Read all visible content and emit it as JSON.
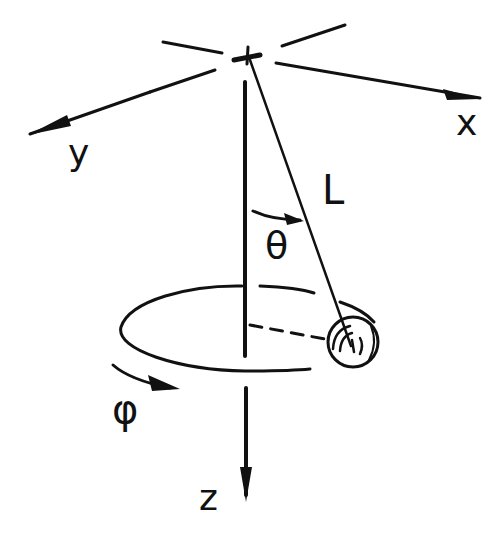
{
  "diagram": {
    "style": "hand-drawn sketch",
    "colors": {
      "ink": "#111111",
      "background": "#ffffff"
    },
    "labels": {
      "x_axis": "x",
      "y_axis": "y",
      "z_axis": "z",
      "length": "L",
      "polar_angle": "θ",
      "azimuthal_angle": "φ"
    },
    "elements": [
      {
        "id": "pivot",
        "description": "suspension point at origin (marked with a cross)"
      },
      {
        "id": "x-axis",
        "description": "arrow pointing right-down toward x"
      },
      {
        "id": "y-axis",
        "description": "arrow pointing left-down toward y"
      },
      {
        "id": "z-axis",
        "description": "vertical axis pointing downward toward z"
      },
      {
        "id": "string",
        "description": "pendulum string of length L from pivot to bob"
      },
      {
        "id": "theta-arc",
        "description": "arc with arrow between z-axis and string, labeled θ"
      },
      {
        "id": "orbit-ellipse",
        "description": "horizontal circular path of the bob, drawn as an ellipse"
      },
      {
        "id": "radius-dashed",
        "description": "dashed line from z-axis to the bob"
      },
      {
        "id": "bob",
        "description": "pendulum mass (sphere) on the orbit"
      },
      {
        "id": "phi-arrow",
        "description": "curved arrow indicating azimuthal rotation, labeled φ"
      }
    ]
  }
}
